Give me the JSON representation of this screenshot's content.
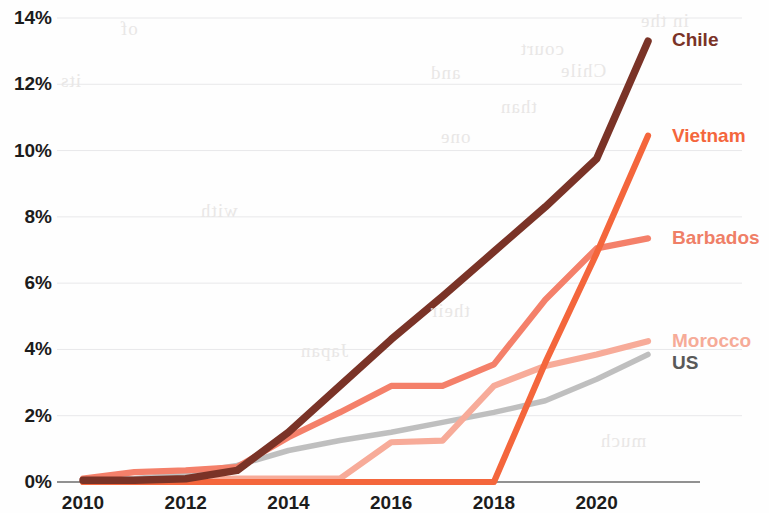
{
  "chart_data": {
    "type": "line",
    "title": "",
    "subtitle": "",
    "xlabel": "",
    "ylabel": "",
    "x": [
      2010,
      2011,
      2012,
      2013,
      2014,
      2015,
      2016,
      2017,
      2018,
      2019,
      2020,
      2021
    ],
    "x_tick_labels": [
      "2010",
      "2012",
      "2014",
      "2016",
      "2018",
      "2020"
    ],
    "x_ticks": [
      2010,
      2012,
      2014,
      2016,
      2018,
      2020
    ],
    "xlim": [
      2010,
      2021
    ],
    "y_tick_labels": [
      "0%",
      "2%",
      "4%",
      "6%",
      "8%",
      "10%",
      "12%",
      "14%"
    ],
    "y_ticks": [
      0,
      2,
      4,
      6,
      8,
      10,
      12,
      14
    ],
    "ylim": [
      0,
      14
    ],
    "y_unit": "%",
    "grid": "horizontal",
    "legend_position": "right-inline",
    "series": [
      {
        "name": "Chile",
        "color": "#7a3327",
        "label_color": "#7a3327",
        "label_y_pct": 13.35,
        "values": [
          0.05,
          0.05,
          0.1,
          0.35,
          1.5,
          2.9,
          4.3,
          5.6,
          6.95,
          8.3,
          9.75,
          13.3
        ]
      },
      {
        "name": "Vietnam",
        "color": "#f4663c",
        "label_color": "#f4663c",
        "label_y_pct": 10.45,
        "values": [
          0.0,
          0.0,
          0.0,
          0.0,
          0.0,
          0.0,
          0.0,
          0.0,
          0.0,
          3.6,
          6.9,
          10.45
        ]
      },
      {
        "name": "Barbados",
        "color": "#f4806a",
        "label_color": "#ef7f67",
        "label_y_pct": 7.35,
        "values": [
          0.1,
          0.3,
          0.35,
          0.45,
          1.35,
          2.1,
          2.9,
          2.9,
          3.55,
          5.5,
          7.05,
          7.35
        ]
      },
      {
        "name": "Morocco",
        "color": "#f7ab99",
        "label_color": "#f6ab98",
        "label_y_pct": 4.25,
        "values": [
          0.05,
          0.05,
          0.05,
          0.1,
          0.1,
          0.1,
          1.2,
          1.25,
          2.9,
          3.5,
          3.85,
          4.25
        ]
      },
      {
        "name": "US",
        "color": "#bcbcbc",
        "label_color": "#595959",
        "label_y_pct": 3.6,
        "values": [
          0.05,
          0.1,
          0.25,
          0.5,
          0.95,
          1.25,
          1.5,
          1.8,
          2.1,
          2.45,
          3.1,
          3.85
        ]
      }
    ]
  },
  "axis": {
    "baseline_color": "#6d6d6d",
    "gridline_color": "#e8e8ea",
    "tick_text_color": "#1c1c1c"
  },
  "bleed_text": {
    "items": [
      "in the",
      "court",
      "and",
      "Chile",
      "than",
      "one",
      "of",
      "its",
      "with",
      "their",
      "much",
      "Japan"
    ]
  }
}
